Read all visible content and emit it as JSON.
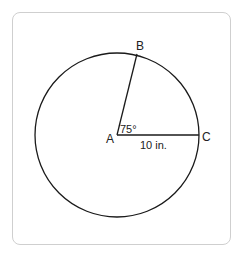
{
  "diagram": {
    "type": "circle-sector",
    "center_label": "A",
    "point_labels": {
      "b": "B",
      "c": "C"
    },
    "angle_label": "75°",
    "radius_label": "10 in.",
    "colors": {
      "stroke": "#1a1a1a",
      "frame": "#cfcfcf",
      "text": "#222222"
    }
  }
}
